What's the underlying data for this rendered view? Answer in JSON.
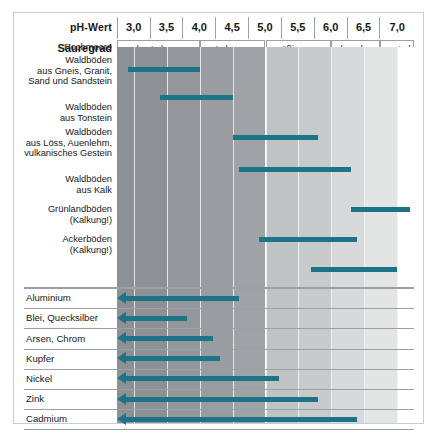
{
  "header": {
    "ph_label": "pH-Wert",
    "acidity_label": "Säuregrad",
    "ph_ticks": [
      "3,0",
      "3,5",
      "4,0",
      "4,5",
      "5,0",
      "5,5",
      "6,0",
      "6,5",
      "7,0"
    ],
    "acidity_classes": [
      {
        "label": "sehr stark sauer",
        "from": 2.74,
        "to": 4.0
      },
      {
        "label": "stark sauer",
        "from": 4.0,
        "to": 5.0
      },
      {
        "label": "mäßig sauer",
        "from": 5.0,
        "to": 6.0
      },
      {
        "label": "schwach sauer",
        "from": 6.0,
        "to": 6.75
      },
      {
        "label": "neutral",
        "from": 6.75,
        "to": 7.26
      }
    ]
  },
  "colors": {
    "bar": "#1d7488",
    "frame": "#c9ccd0",
    "rule": "#9aa0a6",
    "text": "#16181a"
  },
  "chart_data": {
    "type": "bar",
    "xlabel": "pH-Wert",
    "ylabel": "",
    "xlim": [
      2.74,
      7.26
    ],
    "grid": true,
    "legend": "none",
    "x_ticks": [
      3.0,
      3.5,
      4.0,
      4.5,
      5.0,
      5.5,
      6.0,
      6.5,
      7.0
    ],
    "x_tick_labels": [
      "3,0",
      "3,5",
      "4,0",
      "4,5",
      "5,0",
      "5,5",
      "6,0",
      "6,5",
      "7,0"
    ],
    "background_bands": [
      {
        "from": 2.74,
        "to": 3.5,
        "color": "#8e9193"
      },
      {
        "from": 3.5,
        "to": 4.0,
        "color": "#949799"
      },
      {
        "from": 4.0,
        "to": 4.5,
        "color": "#9a9d9f"
      },
      {
        "from": 4.5,
        "to": 5.0,
        "color": "#a0a3a5"
      },
      {
        "from": 5.0,
        "to": 5.5,
        "color": "#c0c3c4"
      },
      {
        "from": 5.5,
        "to": 6.0,
        "color": "#c8cbcc"
      },
      {
        "from": 6.0,
        "to": 6.5,
        "color": "#d7d9da"
      },
      {
        "from": 6.5,
        "to": 7.0,
        "color": "#e3e5e5"
      },
      {
        "from": 7.0,
        "to": 7.26,
        "color": "#ffffff"
      }
    ],
    "series": [
      {
        "name": "Bodentypen",
        "kind": "range-bar",
        "items": [
          {
            "label": "Hochmoore",
            "from": 2.9,
            "to": 4.0
          },
          {
            "label": "Waldböden\naus Gneis, Granit,\nSand und Sandstein",
            "from": 3.4,
            "to": 4.5
          },
          {
            "label": "Waldböden\naus Tonstein",
            "from": 4.5,
            "to": 5.8
          },
          {
            "label": "Waldböden\naus Löss, Auenlehm,\nvulkanisches Gestein",
            "from": 4.6,
            "to": 6.3
          },
          {
            "label": "Waldböden\naus Kalk",
            "from": 6.3,
            "to": 7.2
          },
          {
            "label": "Grünlandböden\n(Kalkung!)",
            "from": 4.9,
            "to": 6.4
          },
          {
            "label": "Ackerböden\n(Kalkung!)",
            "from": 5.7,
            "to": 7.0
          }
        ]
      },
      {
        "name": "Schwermetall-Mobilität",
        "kind": "left-arrow",
        "items": [
          {
            "label": "Aluminium",
            "to": 4.6
          },
          {
            "label": "Blei, Quecksilber",
            "to": 3.8
          },
          {
            "label": "Arsen, Chrom",
            "to": 4.2
          },
          {
            "label": "Kupfer",
            "to": 4.3
          },
          {
            "label": "Nickel",
            "to": 5.2
          },
          {
            "label": "Zink",
            "to": 5.8
          },
          {
            "label": "Cadmium",
            "to": 6.4
          }
        ]
      }
    ]
  }
}
